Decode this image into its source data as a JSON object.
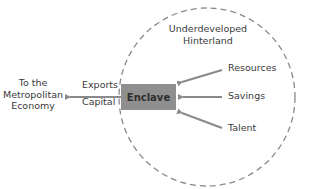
{
  "diagram": {
    "hinterland_label_line1": "Underdeveloped",
    "hinterland_label_line2": "Hinterland",
    "enclave_label": "Enclave",
    "destination_line1": "To the",
    "destination_line2": "Metropolitan",
    "destination_line3": "Economy",
    "outflows": [
      "Exports",
      "Capital"
    ],
    "inflows": [
      "Resources",
      "Savings",
      "Talent"
    ],
    "colors": {
      "circle": "#8a8a8a",
      "arrows": "#8a8a8a",
      "enclave_fill": "#8f8f8f",
      "text": "#3a3a3a"
    }
  }
}
